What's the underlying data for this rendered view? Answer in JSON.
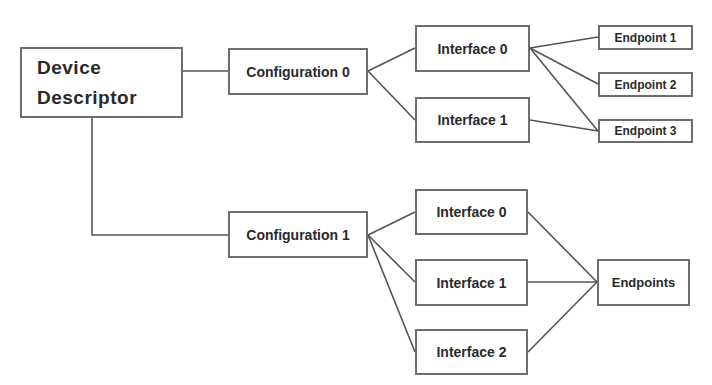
{
  "diagram": {
    "root": {
      "label": "Device Descriptor"
    },
    "configurations": [
      {
        "label": "Configuration 0",
        "interfaces": [
          {
            "label": "Interface 0"
          },
          {
            "label": "Interface 1"
          }
        ],
        "endpoints": [
          {
            "label": "Endpoint 1"
          },
          {
            "label": "Endpoint 2"
          },
          {
            "label": "Endpoint 3"
          }
        ],
        "links": [
          [
            "Interface 0",
            "Endpoint 1"
          ],
          [
            "Interface 0",
            "Endpoint 2"
          ],
          [
            "Interface 0",
            "Endpoint 3"
          ],
          [
            "Interface 1",
            "Endpoint 3"
          ]
        ]
      },
      {
        "label": "Configuration 1",
        "interfaces": [
          {
            "label": "Interface 0"
          },
          {
            "label": "Interface 1"
          },
          {
            "label": "Interface 2"
          }
        ],
        "endpoints": [
          {
            "label": "Endpoints"
          }
        ],
        "links": [
          [
            "Interface 0",
            "Endpoints"
          ],
          [
            "Interface 1",
            "Endpoints"
          ],
          [
            "Interface 2",
            "Endpoints"
          ]
        ]
      }
    ],
    "colors": {
      "line": "#555555",
      "border": "#6e6e6e",
      "text": "#2a2a2a",
      "background": "#ffffff"
    }
  }
}
